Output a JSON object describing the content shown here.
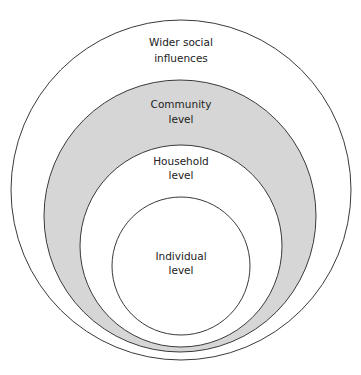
{
  "diagram": {
    "type": "nested-circles",
    "colors": {
      "stroke": "#3a3a3a",
      "background": "#ffffff",
      "community_fill": "#d6d6d6",
      "inner_fill": "#ffffff",
      "text": "#222222"
    },
    "levels": [
      {
        "id": "wider",
        "line1": "Wider social",
        "line2": "influences"
      },
      {
        "id": "community",
        "line1": "Community",
        "line2": "level"
      },
      {
        "id": "household",
        "line1": "Household",
        "line2": "level"
      },
      {
        "id": "individual",
        "line1": "Individual",
        "line2": "level"
      }
    ]
  }
}
